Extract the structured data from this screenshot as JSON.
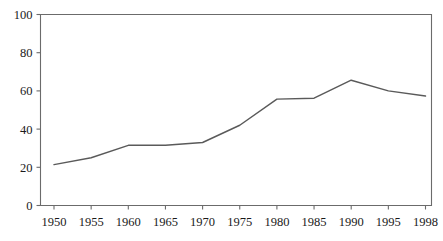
{
  "chart_data": {
    "type": "line",
    "title": "",
    "subtitle": "",
    "xlabel": "",
    "ylabel": "",
    "x": [
      1950,
      1955,
      1960,
      1965,
      1970,
      1975,
      1980,
      1985,
      1990,
      1995,
      1998
    ],
    "categories": [
      "1950",
      "1955",
      "1960",
      "1965",
      "1970",
      "1975",
      "1980",
      "1985",
      "1990",
      "1995",
      "1998"
    ],
    "values": [
      21.4,
      25.0,
      31.5,
      31.5,
      33.0,
      42.0,
      55.7,
      56.2,
      65.6,
      60.0,
      57.3
    ],
    "series": [
      {
        "name": "series-1",
        "values": [
          21.4,
          25.0,
          31.5,
          31.5,
          33.0,
          42.0,
          55.7,
          56.2,
          65.6,
          60.0,
          57.3
        ],
        "color": "#5a5a5a"
      }
    ],
    "xlim": [
      1950,
      1998
    ],
    "ylim": [
      0,
      100
    ],
    "y_ticks": [
      0,
      20,
      40,
      60,
      80,
      100
    ],
    "y_tick_labels": [
      "0",
      "20",
      "40",
      "60",
      "80",
      "100"
    ],
    "x_ticks": [
      1950,
      1955,
      1960,
      1965,
      1970,
      1975,
      1980,
      1985,
      1990,
      1995,
      1998
    ],
    "x_tick_labels": [
      "1950",
      "1955",
      "1960",
      "1965",
      "1970",
      "1975",
      "1980",
      "1985",
      "1990",
      "1995",
      "1998"
    ],
    "grid": false,
    "legend": null,
    "legend_position": "none",
    "annotations": [],
    "frame_color": "#6b6b6b",
    "line_color": "#5a5a5a",
    "background_color": "#ffffff",
    "text_color": "#1a1a1a"
  }
}
